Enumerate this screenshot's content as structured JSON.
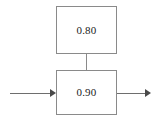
{
  "diagram": {
    "type": "block-diagram",
    "background_color": "#ffffff",
    "border_color": "#8a8a8a",
    "text_color": "#1a1a1a",
    "arrow_color": "#4a4a4a",
    "blocks": [
      {
        "id": "block-top",
        "label": "0.80",
        "position": "top",
        "x": 56,
        "y": 6,
        "width": 61,
        "height": 48
      },
      {
        "id": "block-bottom",
        "label": "0.90",
        "position": "bottom",
        "x": 56,
        "y": 70,
        "width": 61,
        "height": 45
      }
    ],
    "connectors": [
      {
        "id": "connector-top-to-bottom",
        "from": "block-top",
        "to": "block-bottom",
        "orientation": "vertical",
        "arrowhead": false
      }
    ],
    "edges": [
      {
        "id": "edge-input",
        "direction": "right",
        "to": "block-bottom",
        "arrowhead": true
      },
      {
        "id": "edge-output",
        "direction": "right",
        "from": "block-bottom",
        "arrowhead": true
      }
    ]
  }
}
